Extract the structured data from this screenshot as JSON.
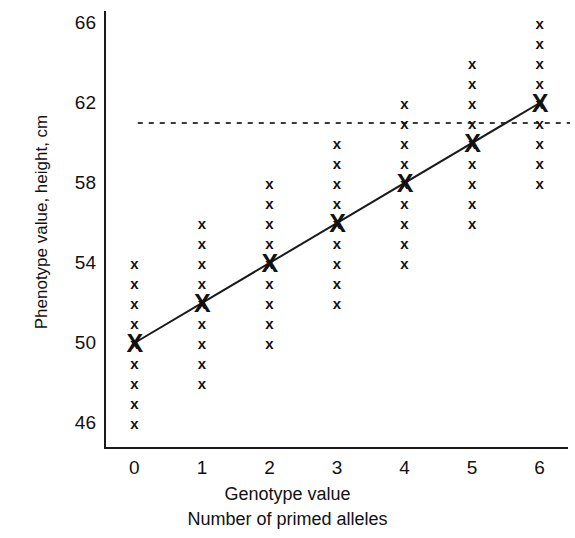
{
  "chart_data": {
    "type": "scatter",
    "title": "",
    "xlabel": "Genotype value",
    "xlabel2": "Number of primed alleles",
    "ylabel": "Phenotype value, height, cm",
    "xlim": [
      -0.45,
      6.45
    ],
    "ylim": [
      44.7,
      66.6
    ],
    "xticks": [
      "0",
      "1",
      "2",
      "3",
      "4",
      "5",
      "6"
    ],
    "xtick_values": [
      0,
      1,
      2,
      3,
      4,
      5,
      6
    ],
    "yticks": [
      "66",
      "62",
      "58",
      "54",
      "50",
      "46"
    ],
    "ytick_values": [
      66,
      62,
      58,
      54,
      50,
      46
    ],
    "grid": false,
    "legend": null,
    "categories": [
      0,
      1,
      2,
      3,
      4,
      5,
      6
    ],
    "series": [
      {
        "name": "Genotypic means",
        "marker": "bold-x",
        "values": [
          50,
          52,
          54,
          56,
          58,
          60,
          62
        ]
      },
      {
        "name": "Individual phenotypes",
        "marker": "x",
        "points": [
          {
            "x": 0,
            "y": [
              46,
              47,
              48,
              49,
              50,
              51,
              52,
              53,
              54
            ]
          },
          {
            "x": 1,
            "y": [
              48,
              49,
              50,
              51,
              52,
              53,
              54,
              55,
              56
            ]
          },
          {
            "x": 2,
            "y": [
              50,
              51,
              52,
              53,
              54,
              55,
              56,
              57,
              58
            ]
          },
          {
            "x": 3,
            "y": [
              52,
              53,
              54,
              55,
              56,
              57,
              58,
              59,
              60
            ]
          },
          {
            "x": 4,
            "y": [
              54,
              55,
              56,
              57,
              58,
              59,
              60,
              61,
              62
            ]
          },
          {
            "x": 5,
            "y": [
              56,
              57,
              58,
              59,
              60,
              61,
              62,
              63,
              64
            ]
          },
          {
            "x": 6,
            "y": [
              58,
              59,
              60,
              61,
              62,
              63,
              64,
              65,
              66
            ]
          }
        ]
      }
    ],
    "regression_line": {
      "name": "Regression of phenotype on genotype",
      "x_start": 0,
      "y_start": 50,
      "x_end": 6,
      "y_end": 62,
      "slope": 2,
      "intercept": 50,
      "style": "solid",
      "color": "#1a1a1a"
    },
    "reference_line": {
      "name": "Threshold",
      "y": 61,
      "style": "dashed",
      "color": "#3a3a3a",
      "x_start": 0.05,
      "x_end": 6.45
    },
    "colors": {
      "axis": "#1a1a1a",
      "marks": "#111111",
      "reference": "#3a3a3a",
      "background": "#ffffff"
    }
  }
}
